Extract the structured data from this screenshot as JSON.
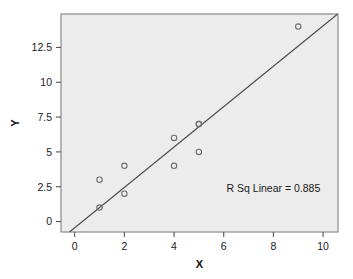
{
  "chart_data": {
    "type": "scatter",
    "title": "",
    "xlabel": "X",
    "ylabel": "Y",
    "xlim": [
      -0.55,
      10.6
    ],
    "ylim": [
      -0.75,
      14.9
    ],
    "xticks": [
      0,
      2,
      4,
      6,
      8,
      10
    ],
    "xtick_labels": [
      "0",
      "2",
      "4",
      "6",
      "8",
      "10"
    ],
    "yticks": [
      0,
      2.5,
      5,
      7.5,
      10,
      12.5
    ],
    "ytick_labels": [
      "0",
      "2.5",
      "5",
      "7.5",
      "10",
      "12.5"
    ],
    "grid": false,
    "legend": "none",
    "points": [
      {
        "x": 1,
        "y": 3
      },
      {
        "x": 1,
        "y": 1
      },
      {
        "x": 2,
        "y": 4
      },
      {
        "x": 2,
        "y": 2
      },
      {
        "x": 4,
        "y": 6
      },
      {
        "x": 4,
        "y": 4
      },
      {
        "x": 5,
        "y": 7
      },
      {
        "x": 5,
        "y": 7
      },
      {
        "x": 5,
        "y": 5
      },
      {
        "x": 9,
        "y": 14
      }
    ],
    "fit_line": {
      "kind": "linear",
      "slope": 1.45,
      "intercept": -0.45,
      "x_start": -0.55,
      "x_end": 10.6
    },
    "annotations": [
      {
        "name": "r-squared-annotation",
        "text": "R Sq Linear = 0.885",
        "x": 8.0,
        "y": 2.1
      }
    ],
    "colors": {
      "plot_background": "#ececec",
      "plot_border": "#8c8c8c",
      "marker_stroke": "#6e6e6e",
      "marker_fill": "none",
      "fit_line": "#4d4d4d",
      "tick_color": "#555555",
      "text": "#1a1a1a",
      "figure_background": "#ffffff"
    }
  },
  "axes": {
    "x_title": "X",
    "y_title": "Y"
  }
}
